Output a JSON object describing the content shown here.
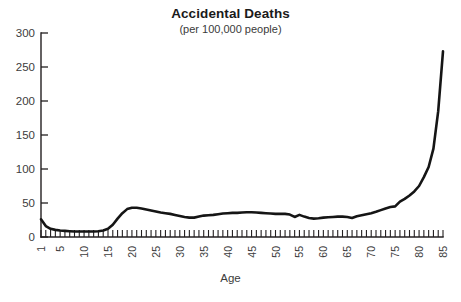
{
  "chart_data": {
    "type": "line",
    "title": "Accidental Deaths",
    "subtitle": "(per 100,000 people)",
    "xlabel": "Age",
    "ylabel": "",
    "xlim": [
      1,
      85
    ],
    "ylim": [
      0,
      300
    ],
    "grid": false,
    "legend": false,
    "yticks": [
      0,
      50,
      100,
      150,
      200,
      250,
      300
    ],
    "ytick_labels": [
      "0",
      "50",
      "100",
      "150",
      "200",
      "250",
      "300"
    ],
    "xticks": [
      1,
      5,
      10,
      15,
      20,
      25,
      30,
      35,
      40,
      45,
      50,
      55,
      60,
      65,
      70,
      75,
      80,
      85
    ],
    "xtick_labels": [
      "1",
      "5",
      "10",
      "15",
      "20",
      "25",
      "30",
      "35",
      "40",
      "45",
      "50",
      "55",
      "60",
      "65",
      "70",
      "75",
      "80",
      "85"
    ],
    "xtick_rotation": 90,
    "minor_xticks_every": 1,
    "line_color": "#151515",
    "series": [
      {
        "name": "Accidental death rate",
        "x": [
          1,
          2,
          3,
          4,
          5,
          6,
          7,
          8,
          9,
          10,
          11,
          12,
          13,
          14,
          15,
          16,
          17,
          18,
          19,
          20,
          21,
          22,
          23,
          24,
          25,
          26,
          27,
          28,
          29,
          30,
          31,
          32,
          33,
          34,
          35,
          36,
          37,
          38,
          39,
          40,
          41,
          42,
          43,
          44,
          45,
          46,
          47,
          48,
          49,
          50,
          51,
          52,
          53,
          54,
          55,
          56,
          57,
          58,
          59,
          60,
          61,
          62,
          63,
          64,
          65,
          66,
          67,
          68,
          69,
          70,
          71,
          72,
          73,
          74,
          75,
          76,
          77,
          78,
          79,
          80,
          81,
          82,
          83,
          84,
          85
        ],
        "values": [
          26,
          16,
          12,
          10.5,
          9.5,
          9,
          8.5,
          8,
          8,
          8,
          8,
          8,
          8.5,
          9.5,
          12,
          18,
          27,
          35,
          41,
          43,
          43,
          42,
          40.5,
          39,
          37.5,
          36,
          35,
          34,
          32.5,
          31,
          29.5,
          28.5,
          28.5,
          30,
          31.5,
          32,
          32.5,
          33.5,
          34.5,
          35,
          35.5,
          35.5,
          36,
          36.5,
          36.5,
          36,
          35.5,
          35,
          34.5,
          34,
          34,
          34,
          33,
          29.5,
          32.5,
          30,
          28,
          27,
          27.5,
          28.5,
          29,
          29.5,
          30,
          30,
          29.5,
          28,
          30.5,
          32,
          33.5,
          35,
          37,
          39.5,
          42,
          44,
          45,
          52,
          56,
          61,
          67,
          75,
          88,
          103,
          130,
          185,
          273
        ]
      }
    ]
  }
}
